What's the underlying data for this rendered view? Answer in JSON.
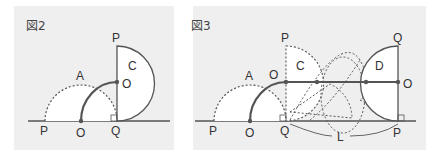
{
  "figures": [
    {
      "title": "図2",
      "labels": {
        "A": "A",
        "C": "C",
        "P_top": "P",
        "O_mid": "O",
        "P_base": "P",
        "O_base": "O",
        "Q_base": "Q"
      }
    },
    {
      "title": "図3",
      "labels": {
        "A": "A",
        "C": "C",
        "D": "D",
        "P_top": "P",
        "O_mid": "O",
        "P_base": "P",
        "O_base": "O",
        "Q_base": "Q",
        "Q_top": "Q",
        "O_right": "O",
        "P_right": "P",
        "L": "L"
      }
    }
  ],
  "colors": {
    "background": "#efefef",
    "line": "#555555",
    "fill": "#ffffff"
  }
}
